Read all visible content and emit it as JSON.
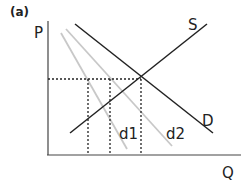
{
  "panel_label": "(a)",
  "axes": {
    "y_label": "P",
    "x_label": "Q"
  },
  "curves": {
    "supply": {
      "label": "S",
      "color": "#222222"
    },
    "demand": {
      "label": "D",
      "color": "#222222"
    },
    "demand1": {
      "label": "d1",
      "color": "#c8c8c8"
    },
    "demand2": {
      "label": "d2",
      "color": "#c8c8c8"
    }
  },
  "guides": {
    "style": "dotted",
    "color": "#222222"
  }
}
